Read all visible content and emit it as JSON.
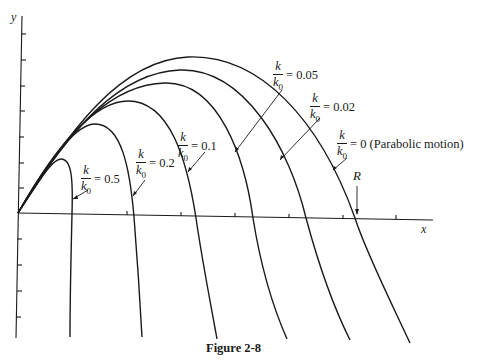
{
  "figure": {
    "caption": "Figure 2-8",
    "axes": {
      "x_label": "x",
      "y_label": "y",
      "range_marker": "R"
    },
    "curves": [
      {
        "id": "k0",
        "ratio_num": "k",
        "ratio_den": "k",
        "ratio_den_sub": "0",
        "value": "= 0 (Parabolic motion)"
      },
      {
        "id": "k002",
        "ratio_num": "k",
        "ratio_den": "k",
        "ratio_den_sub": "0",
        "value": "= 0.02"
      },
      {
        "id": "k005",
        "ratio_num": "k",
        "ratio_den": "k",
        "ratio_den_sub": "0",
        "value": "= 0.05"
      },
      {
        "id": "k01",
        "ratio_num": "k",
        "ratio_den": "k",
        "ratio_den_sub": "0",
        "value": "= 0.1"
      },
      {
        "id": "k02",
        "ratio_num": "k",
        "ratio_den": "k",
        "ratio_den_sub": "0",
        "value": "= 0.2"
      },
      {
        "id": "k05",
        "ratio_num": "k",
        "ratio_den": "k",
        "ratio_den_sub": "0",
        "value": "= 0.5"
      }
    ]
  }
}
